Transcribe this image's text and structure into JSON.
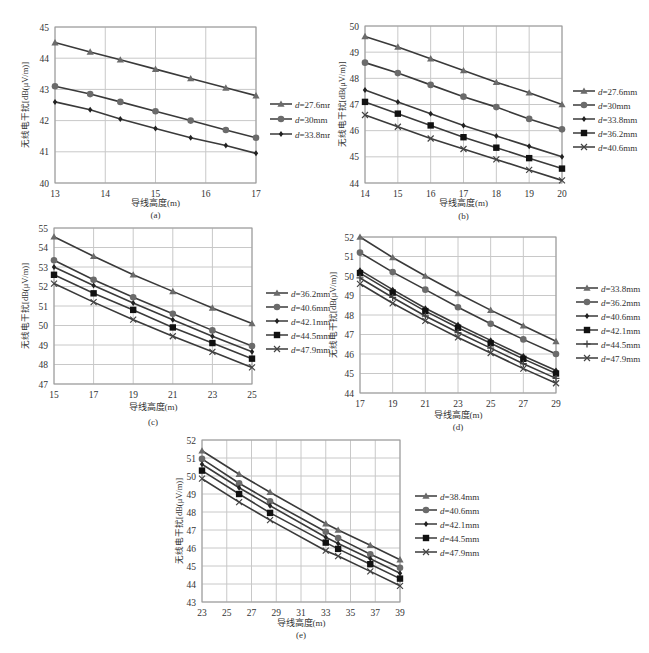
{
  "figure": {
    "ylabel": "无线电干扰[dB(μV/m)]",
    "xlabel": "导线高度(m)"
  },
  "chart_data": [
    {
      "id": "a",
      "type": "line",
      "caption": "(a)",
      "xlabel": "导线高度(m)",
      "ylabel": "无线电干扰[dB(μV/m)]",
      "xlim": [
        13,
        17
      ],
      "ylim": [
        40,
        45
      ],
      "xticks": [
        13,
        14,
        15,
        16,
        17
      ],
      "yticks": [
        40,
        41,
        42,
        43,
        44,
        45
      ],
      "grid": true,
      "legend_position": "right",
      "x": [
        13,
        13.7,
        14.3,
        15,
        15.7,
        16.4,
        17
      ],
      "series": [
        {
          "name": "d=27.6mm",
          "marker": "triangle",
          "values": [
            44.5,
            44.2,
            43.95,
            43.65,
            43.35,
            43.05,
            42.8
          ]
        },
        {
          "name": "d=30mm",
          "marker": "circle",
          "values": [
            43.1,
            42.85,
            42.6,
            42.3,
            42.0,
            41.7,
            41.45
          ]
        },
        {
          "name": "d=33.8mm",
          "marker": "diamond",
          "values": [
            42.6,
            42.35,
            42.05,
            41.75,
            41.45,
            41.2,
            40.95
          ]
        }
      ]
    },
    {
      "id": "b",
      "type": "line",
      "caption": "(b)",
      "xlabel": "导线高度(m)",
      "ylabel": "无线电干扰[dB(μV/m)]",
      "xlim": [
        14,
        20
      ],
      "ylim": [
        44,
        50
      ],
      "xticks": [
        14,
        15,
        16,
        17,
        18,
        19,
        20
      ],
      "yticks": [
        44,
        45,
        46,
        47,
        48,
        49,
        50
      ],
      "grid": true,
      "legend_position": "right",
      "x": [
        14,
        15,
        16,
        17,
        18,
        19,
        20
      ],
      "series": [
        {
          "name": "d=27.6mm",
          "marker": "triangle",
          "values": [
            49.6,
            49.2,
            48.75,
            48.3,
            47.85,
            47.45,
            47.0
          ]
        },
        {
          "name": "d=30mm",
          "marker": "circle",
          "values": [
            48.6,
            48.2,
            47.75,
            47.3,
            46.9,
            46.45,
            46.05
          ]
        },
        {
          "name": "d=33.8mm",
          "marker": "diamond",
          "values": [
            47.55,
            47.1,
            46.65,
            46.2,
            45.8,
            45.4,
            45.0
          ]
        },
        {
          "name": "d=36.2mm",
          "marker": "square",
          "values": [
            47.1,
            46.65,
            46.2,
            45.75,
            45.35,
            44.95,
            44.55
          ]
        },
        {
          "name": "d=40.6mm",
          "marker": "cross",
          "values": [
            46.6,
            46.15,
            45.7,
            45.3,
            44.9,
            44.5,
            44.1
          ]
        }
      ]
    },
    {
      "id": "c",
      "type": "line",
      "caption": "(c)",
      "xlabel": "导线高度(m)",
      "ylabel": "无线电干扰[dB(μV/m)]",
      "xlim": [
        15,
        25
      ],
      "ylim": [
        47,
        55
      ],
      "xticks": [
        15,
        17,
        19,
        21,
        23,
        25
      ],
      "yticks": [
        47,
        48,
        49,
        50,
        51,
        52,
        53,
        54,
        55
      ],
      "grid": true,
      "legend_position": "right",
      "x": [
        15,
        17,
        19,
        21,
        23,
        25
      ],
      "series": [
        {
          "name": "d=36.2mm",
          "marker": "triangle",
          "values": [
            54.55,
            53.55,
            52.6,
            51.75,
            50.9,
            50.1
          ]
        },
        {
          "name": "d=40.6mm",
          "marker": "circle",
          "values": [
            53.35,
            52.35,
            51.45,
            50.6,
            49.75,
            48.95
          ]
        },
        {
          "name": "d=42.1mm",
          "marker": "diamond",
          "values": [
            53.0,
            52.05,
            51.15,
            50.3,
            49.45,
            48.65
          ]
        },
        {
          "name": "d=44.5mm",
          "marker": "square",
          "values": [
            52.6,
            51.65,
            50.8,
            49.9,
            49.1,
            48.3
          ]
        },
        {
          "name": "d=47.9mm",
          "marker": "cross",
          "values": [
            52.15,
            51.2,
            50.3,
            49.45,
            48.65,
            47.85
          ]
        }
      ]
    },
    {
      "id": "d",
      "type": "line",
      "caption": "(d)",
      "xlabel": "导线高度(m)",
      "ylabel": "无线电干扰[dB(μV/m)]",
      "xlim": [
        17,
        29
      ],
      "ylim": [
        44,
        52
      ],
      "xticks": [
        17,
        19,
        21,
        23,
        25,
        27,
        29
      ],
      "yticks": [
        44,
        45,
        46,
        47,
        48,
        49,
        50,
        51,
        52
      ],
      "grid": true,
      "legend_position": "right",
      "x": [
        17,
        19,
        21,
        23,
        25,
        27,
        29
      ],
      "series": [
        {
          "name": "d=33.8mm",
          "marker": "triangle",
          "values": [
            52.0,
            50.95,
            50.0,
            49.1,
            48.25,
            47.45,
            46.65
          ]
        },
        {
          "name": "d=36.2mm",
          "marker": "circle",
          "values": [
            51.2,
            50.2,
            49.3,
            48.4,
            47.55,
            46.75,
            46.0
          ]
        },
        {
          "name": "d=40.6mm",
          "marker": "diamond",
          "values": [
            50.3,
            49.3,
            48.35,
            47.5,
            46.7,
            45.9,
            45.15
          ]
        },
        {
          "name": "d=42.1mm",
          "marker": "square",
          "values": [
            50.15,
            49.15,
            48.2,
            47.35,
            46.55,
            45.75,
            45.0
          ]
        },
        {
          "name": "d=44.5mm",
          "marker": "plus",
          "values": [
            49.9,
            48.9,
            47.95,
            47.1,
            46.3,
            45.5,
            44.75
          ]
        },
        {
          "name": "d=47.9mm",
          "marker": "cross",
          "values": [
            49.6,
            48.6,
            47.7,
            46.85,
            46.05,
            45.25,
            44.5
          ]
        }
      ]
    },
    {
      "id": "e",
      "type": "line",
      "caption": "(e)",
      "xlabel": "导线高度(m)",
      "ylabel": "无线电干扰[dB(μV/m)]",
      "xlim": [
        23,
        39
      ],
      "ylim": [
        43,
        52
      ],
      "xticks": [
        23,
        25,
        27,
        29,
        31,
        33,
        35,
        37,
        39
      ],
      "yticks": [
        43,
        44,
        45,
        46,
        47,
        48,
        49,
        50,
        51,
        52
      ],
      "grid": true,
      "legend_position": "right",
      "x": [
        23,
        26,
        28.5,
        33,
        34,
        36.6,
        39
      ],
      "series": [
        {
          "name": "d=38.4mm",
          "marker": "triangle",
          "values": [
            51.4,
            50.1,
            49.1,
            47.35,
            47.0,
            46.15,
            45.35
          ]
        },
        {
          "name": "d=40.6mm",
          "marker": "circle",
          "values": [
            50.95,
            49.6,
            48.6,
            46.9,
            46.55,
            45.65,
            44.9
          ]
        },
        {
          "name": "d=42.1mm",
          "marker": "diamond",
          "values": [
            50.65,
            49.35,
            48.35,
            46.6,
            46.25,
            45.4,
            44.6
          ]
        },
        {
          "name": "d=44.5mm",
          "marker": "square",
          "values": [
            50.3,
            49.0,
            47.95,
            46.3,
            45.95,
            45.1,
            44.3
          ]
        },
        {
          "name": "d=47.9mm",
          "marker": "cross",
          "values": [
            49.85,
            48.55,
            47.55,
            45.85,
            45.55,
            44.7,
            43.9
          ]
        }
      ]
    }
  ],
  "layout": {
    "panels": [
      {
        "id": "a",
        "left": 0,
        "top": 0,
        "width": 330,
        "height": 225,
        "plot": {
          "x": 55,
          "y": 27,
          "w": 201,
          "h": 156
        },
        "legend": {
          "x": 270,
          "y": 104,
          "dy": 15
        },
        "xlabelY": 206,
        "captionY": 218,
        "ylabelX": 28
      },
      {
        "id": "b",
        "left": 325,
        "top": 0,
        "width": 324,
        "height": 225,
        "plot": {
          "x": 40,
          "y": 26,
          "w": 197,
          "h": 157
        },
        "legend": {
          "x": 248,
          "y": 91,
          "dy": 14
        },
        "xlabelY": 206,
        "captionY": 219,
        "ylabelX": 20
      },
      {
        "id": "c",
        "left": 0,
        "top": 225,
        "width": 330,
        "height": 210,
        "plot": {
          "x": 54,
          "y": 3,
          "w": 198,
          "h": 156
        },
        "legend": {
          "x": 266,
          "y": 68,
          "dy": 14
        },
        "xlabelY": 185,
        "captionY": 200,
        "ylabelX": 28
      },
      {
        "id": "d",
        "left": 320,
        "top": 225,
        "width": 329,
        "height": 220,
        "plot": {
          "x": 40,
          "y": 12,
          "w": 196,
          "h": 156
        },
        "legend": {
          "x": 256,
          "y": 63,
          "dy": 14
        },
        "xlabelY": 193,
        "captionY": 205,
        "ylabelX": 16
      },
      {
        "id": "e",
        "left": 150,
        "top": 430,
        "width": 350,
        "height": 223,
        "plot": {
          "x": 52,
          "y": 10,
          "w": 198,
          "h": 162
        },
        "legend": {
          "x": 265,
          "y": 66,
          "dy": 14
        },
        "xlabelY": 196,
        "captionY": 208,
        "ylabelX": 32
      }
    ]
  },
  "colors": {
    "line": "#3a3a3a",
    "triangle": "#6b6b6b",
    "circle": "#6b6b6b",
    "diamond": "#222222",
    "square": "#111111",
    "plus": "#444444",
    "cross": "#444444",
    "grid": "#c8c8c8",
    "axis": "#999999"
  }
}
